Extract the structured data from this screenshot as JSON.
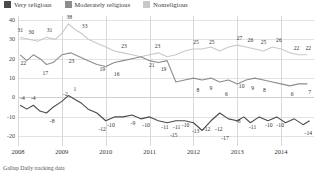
{
  "legend": {
    "items": [
      {
        "label": "Very religious",
        "color": "#4a4a4a",
        "key": "very"
      },
      {
        "label": "Moderately religious",
        "color": "#8d8d8d",
        "key": "moderate"
      },
      {
        "label": "Nonreligious",
        "color": "#c9c9c9",
        "key": "non"
      }
    ]
  },
  "source": "Gallup Daily tracking data",
  "chart_data": {
    "type": "line",
    "title": "",
    "subtitle": "",
    "xlabel": "",
    "ylabel": "",
    "ylim": [
      -25,
      42
    ],
    "xlim": [
      2008.0,
      2014.75
    ],
    "grid": true,
    "legend_position": "top-left",
    "yticks": [
      40,
      30,
      20,
      10,
      0,
      -10,
      -20
    ],
    "ytick_labels": [
      "40",
      "30",
      "20",
      "10",
      "0",
      "-10",
      "-20"
    ],
    "xticks": [
      2008,
      2009,
      2010,
      2011,
      2012,
      2013,
      2014
    ],
    "xtick_labels": [
      "2008",
      "2009",
      "2010",
      "2011",
      "2012",
      "2013",
      "2014"
    ],
    "series": [
      {
        "name": "Nonreligious",
        "color": "#c9c9c9",
        "x": [
          2008.05,
          2008.25,
          2008.45,
          2008.65,
          2008.85,
          2009.0,
          2009.15,
          2009.3,
          2009.45,
          2009.6,
          2009.8,
          2010.0,
          2010.2,
          2010.4,
          2010.6,
          2010.8,
          2011.0,
          2011.2,
          2011.4,
          2011.6,
          2011.8,
          2012.0,
          2012.2,
          2012.4,
          2012.6,
          2012.8,
          2013.0,
          2013.2,
          2013.4,
          2013.6,
          2013.8,
          2014.0,
          2014.2,
          2014.4,
          2014.6
        ],
        "y": [
          31,
          30,
          29,
          31,
          30,
          33,
          38,
          35,
          33,
          30,
          28,
          26,
          24,
          23,
          22,
          21,
          22,
          23,
          21,
          22,
          24,
          25,
          25,
          26,
          24,
          26,
          27,
          26,
          25,
          24,
          26,
          25,
          23,
          22,
          22
        ],
        "labels": [
          {
            "x": 2008.05,
            "y": 31,
            "text": "31"
          },
          {
            "x": 2008.3,
            "y": 30,
            "text": "30"
          },
          {
            "x": 2008.72,
            "y": 31,
            "text": "31"
          },
          {
            "x": 2009.17,
            "y": 38,
            "text": "38"
          },
          {
            "x": 2009.52,
            "y": 33,
            "text": "33"
          },
          {
            "x": 2010.42,
            "y": 23,
            "text": "23"
          },
          {
            "x": 2011.18,
            "y": 23,
            "text": "23"
          },
          {
            "x": 2012.06,
            "y": 25,
            "text": "25"
          },
          {
            "x": 2012.42,
            "y": 25,
            "text": "25"
          },
          {
            "x": 2013.05,
            "y": 27,
            "text": "27"
          },
          {
            "x": 2013.3,
            "y": 26,
            "text": "26"
          },
          {
            "x": 2013.6,
            "y": 25,
            "text": "25"
          },
          {
            "x": 2013.95,
            "y": 26,
            "text": "26"
          },
          {
            "x": 2014.35,
            "y": 22,
            "text": "22"
          },
          {
            "x": 2014.62,
            "y": 22,
            "text": "22"
          }
        ]
      },
      {
        "name": "Moderately religious",
        "color": "#8d8d8d",
        "x": [
          2008.05,
          2008.2,
          2008.35,
          2008.5,
          2008.65,
          2008.8,
          2009.0,
          2009.2,
          2009.4,
          2009.6,
          2009.8,
          2010.0,
          2010.2,
          2010.4,
          2010.6,
          2010.8,
          2011.0,
          2011.2,
          2011.4,
          2011.6,
          2011.8,
          2012.0,
          2012.2,
          2012.4,
          2012.6,
          2012.8,
          2013.0,
          2013.2,
          2013.4,
          2013.6,
          2013.8,
          2014.0,
          2014.2,
          2014.4,
          2014.6
        ],
        "y": [
          22,
          19,
          22,
          20,
          17,
          18,
          22,
          23,
          21,
          19,
          17,
          16,
          18,
          19,
          20,
          21,
          19,
          18,
          19,
          8,
          9,
          10,
          9,
          10,
          8,
          9,
          7,
          9,
          10,
          9,
          8,
          7,
          6,
          7,
          7
        ],
        "labels": [
          {
            "x": 2008.12,
            "y": 22,
            "text": "22"
          },
          {
            "x": 2008.62,
            "y": 17,
            "text": "17"
          },
          {
            "x": 2009.22,
            "y": 23,
            "text": "23"
          },
          {
            "x": 2009.92,
            "y": 19,
            "text": "19"
          },
          {
            "x": 2010.25,
            "y": 16,
            "text": "16"
          },
          {
            "x": 2011.05,
            "y": 21,
            "text": "21"
          },
          {
            "x": 2011.32,
            "y": 19,
            "text": "19"
          },
          {
            "x": 2012.1,
            "y": 8,
            "text": "8"
          },
          {
            "x": 2012.4,
            "y": 9,
            "text": "9"
          },
          {
            "x": 2012.75,
            "y": 6,
            "text": "6"
          },
          {
            "x": 2013.1,
            "y": 10,
            "text": "10"
          },
          {
            "x": 2013.35,
            "y": 9,
            "text": "9"
          },
          {
            "x": 2013.62,
            "y": 8,
            "text": "8"
          },
          {
            "x": 2014.25,
            "y": 6,
            "text": "6"
          },
          {
            "x": 2014.65,
            "y": 7,
            "text": "7"
          }
        ]
      },
      {
        "name": "Very religious",
        "color": "#4a4a4a",
        "x": [
          2008.05,
          2008.2,
          2008.35,
          2008.5,
          2008.65,
          2008.8,
          2009.0,
          2009.15,
          2009.3,
          2009.45,
          2009.6,
          2009.8,
          2010.0,
          2010.2,
          2010.4,
          2010.6,
          2010.8,
          2011.0,
          2011.2,
          2011.4,
          2011.6,
          2011.8,
          2012.0,
          2012.2,
          2012.4,
          2012.6,
          2012.8,
          2013.0,
          2013.15,
          2013.3,
          2013.5,
          2013.7,
          2013.9,
          2014.1,
          2014.3,
          2014.5,
          2014.65
        ],
        "y": [
          -4,
          -6,
          -4,
          -7,
          -8,
          -5,
          -2,
          1,
          -1,
          -3,
          -6,
          -8,
          -12,
          -10,
          -10,
          -9,
          -11,
          -10,
          -12,
          -13,
          -12,
          -12,
          -13,
          -17,
          -12,
          -8,
          -11,
          -12,
          -10,
          -13,
          -10,
          -12,
          -10,
          -13,
          -11,
          -14,
          -12
        ],
        "labels": [
          {
            "x": 2008.1,
            "y": -4,
            "text": "-4"
          },
          {
            "x": 2008.35,
            "y": -4,
            "text": "-4"
          },
          {
            "x": 2008.78,
            "y": -8,
            "text": "-8"
          },
          {
            "x": 2009.08,
            "y": -2,
            "text": "-2"
          },
          {
            "x": 2009.3,
            "y": 1,
            "text": "1"
          },
          {
            "x": 2009.92,
            "y": -12,
            "text": "-12"
          },
          {
            "x": 2010.12,
            "y": -10,
            "text": "-10"
          },
          {
            "x": 2010.62,
            "y": -9,
            "text": "-9"
          },
          {
            "x": 2010.92,
            "y": -10,
            "text": "-10"
          },
          {
            "x": 2011.35,
            "y": -11,
            "text": "-11"
          },
          {
            "x": 2011.62,
            "y": -11,
            "text": "-11"
          },
          {
            "x": 2011.82,
            "y": -10,
            "text": "-10"
          },
          {
            "x": 2011.55,
            "y": -15,
            "text": "-15"
          },
          {
            "x": 2012.05,
            "y": -13,
            "text": "-13"
          },
          {
            "x": 2012.3,
            "y": -12,
            "text": "-12"
          },
          {
            "x": 2012.58,
            "y": -12,
            "text": "-12"
          },
          {
            "x": 2012.72,
            "y": -17,
            "text": "-17"
          },
          {
            "x": 2013.02,
            "y": -8,
            "text": "-8"
          },
          {
            "x": 2013.35,
            "y": -11,
            "text": "-11"
          },
          {
            "x": 2013.72,
            "y": -10,
            "text": "-10"
          },
          {
            "x": 2013.98,
            "y": -10,
            "text": "-10"
          },
          {
            "x": 2014.62,
            "y": -14,
            "text": "-14"
          }
        ]
      }
    ]
  }
}
